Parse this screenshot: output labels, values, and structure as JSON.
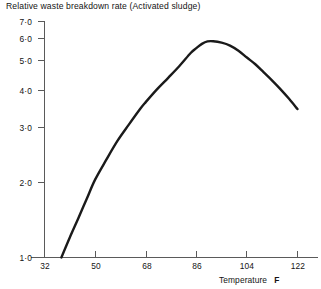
{
  "chart_data": {
    "type": "line",
    "title": "Relative waste breakdown rate (Activated sludge)",
    "xlabel": "Temperature",
    "xunit": "F",
    "ylabel": "",
    "yscale": "log",
    "xlim": [
      32,
      122
    ],
    "ylim": [
      1.0,
      7.0
    ],
    "grid": false,
    "legend": null,
    "xticks": [
      32,
      50,
      68,
      86,
      104,
      122
    ],
    "xtick_labels": [
      "32",
      "50",
      "68",
      "86",
      "104",
      "122"
    ],
    "yticks": [
      1.0,
      2.0,
      3.0,
      4.0,
      5.0,
      6.0,
      7.0
    ],
    "ytick_labels": [
      "1·0",
      "2·0",
      "3·0",
      "4·0",
      "5·0",
      "6·0",
      "7·0"
    ],
    "series": [
      {
        "name": "Relative waste breakdown rate",
        "x": [
          38,
          41,
          44,
          47,
          50,
          54,
          58,
          62,
          66,
          68,
          72,
          76,
          80,
          84,
          86,
          88,
          90,
          92,
          95,
          98,
          101,
          104,
          107,
          110,
          113,
          116,
          119,
          122
        ],
        "values": [
          1.0,
          1.18,
          1.38,
          1.62,
          1.9,
          2.24,
          2.62,
          2.99,
          3.4,
          3.6,
          4.0,
          4.4,
          4.85,
          5.4,
          5.62,
          5.82,
          5.94,
          5.95,
          5.88,
          5.74,
          5.5,
          5.2,
          4.92,
          4.6,
          4.3,
          4.0,
          3.7,
          3.4
        ]
      }
    ],
    "annotations": {
      "peak_temperature_f": 91,
      "peak_value": 5.95,
      "curve_start_temperature_f": 38,
      "curve_end_temperature_f": 122,
      "curve_end_value": 3.4
    },
    "style": {
      "curve_color": "#1a1a1a",
      "axis_color": "#5a5a5a",
      "background": "#ffffff"
    }
  }
}
